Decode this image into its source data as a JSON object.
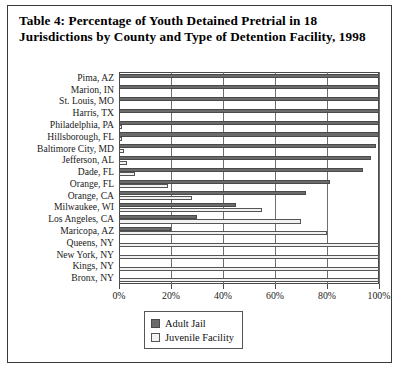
{
  "figure": {
    "title": "Table 4: Percentage of Youth Detained Pretrial in 18 Jurisdictions by County and Type of Detention Facility, 1998"
  },
  "legend": {
    "items": [
      {
        "label": "Adult Jail",
        "swatch": "dark-gray-swatch-icon",
        "color": "#6b6b6b"
      },
      {
        "label": "Juvenile Facility",
        "swatch": "light-gray-swatch-icon",
        "color": "#f2f2f2"
      }
    ]
  },
  "axis": {
    "x_ticks": [
      "0%",
      "20%",
      "40%",
      "60%",
      "80%",
      "100%"
    ],
    "x_tick_values": [
      0,
      20,
      40,
      60,
      80,
      100
    ]
  },
  "chart_data": {
    "type": "bar",
    "orientation": "horizontal",
    "title": "Table 4: Percentage of Youth Detained Pretrial in 18 Jurisdictions by County and Type of Detention Facility, 1998",
    "xlabel": "",
    "ylabel": "",
    "xlim": [
      0,
      100
    ],
    "xticks": [
      0,
      20,
      40,
      60,
      80,
      100
    ],
    "xticklabels": [
      "0%",
      "20%",
      "40%",
      "60%",
      "80%",
      "100%"
    ],
    "grid": true,
    "legend_position": "bottom-center",
    "categories": [
      "Pima, AZ",
      "Marion, IN",
      "St. Louis, MO",
      "Harris, TX",
      "Philadelphia, PA",
      "Hillsborough, FL",
      "Baltimore City, MD",
      "Jefferson, AL",
      "Dade, FL",
      "Orange, FL",
      "Orange, CA",
      "Milwaukee, WI",
      "Los Angeles, CA",
      "Maricopa, AZ",
      "Queens, NY",
      "New York, NY",
      "Kings, NY",
      "Bronx, NY"
    ],
    "series": [
      {
        "name": "Adult Jail",
        "color": "#6b6b6b",
        "values": [
          100,
          100,
          100,
          100,
          100,
          100,
          99,
          97,
          94,
          81,
          72,
          45,
          30,
          20,
          0,
          0,
          0,
          0
        ]
      },
      {
        "name": "Juvenile Facility",
        "color": "#f2f2f2",
        "values": [
          0,
          0,
          0,
          0,
          1,
          1,
          2,
          3,
          6,
          19,
          28,
          55,
          70,
          80,
          100,
          100,
          100,
          100
        ]
      }
    ]
  }
}
